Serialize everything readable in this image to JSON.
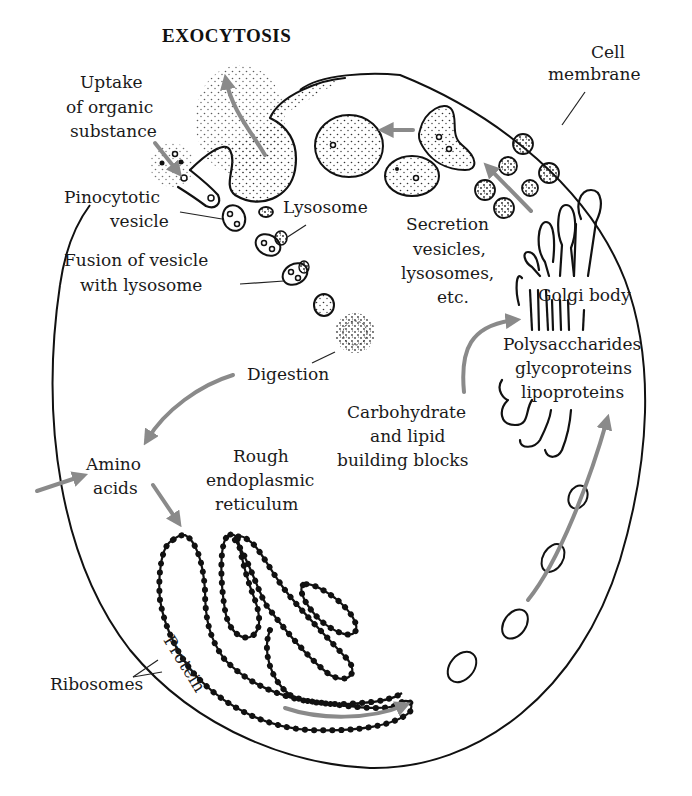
{
  "diagram": {
    "title": "EXOCYTOSIS",
    "labels": {
      "cell_membrane": [
        "Cell",
        "membrane"
      ],
      "uptake": [
        "Uptake",
        "of organic",
        "substance"
      ],
      "pinocytotic_vesicle": [
        "Pinocytotic",
        "vesicle"
      ],
      "lysosome": "Lysosome",
      "fusion": [
        "Fusion of vesicle",
        "with lysosome"
      ],
      "secretion": [
        "Secretion",
        "vesicles,",
        "lysosomes,",
        "etc."
      ],
      "golgi": "Golgi body",
      "polysaccharides": [
        "Polysaccharides",
        "glycoproteins",
        "lipoproteins"
      ],
      "digestion": "Digestion",
      "carbohydrate": [
        "Carbohydrate",
        "and lipid",
        "building blocks"
      ],
      "amino_acids": [
        "Amino",
        "acids"
      ],
      "rough_er": [
        "Rough",
        "endoplasmic",
        "reticulum"
      ],
      "ribosomes": "Ribosomes",
      "protein": "Protein"
    },
    "colors": {
      "ink": "#111111",
      "arrow": "#8a8a8a",
      "background": "#ffffff"
    }
  }
}
